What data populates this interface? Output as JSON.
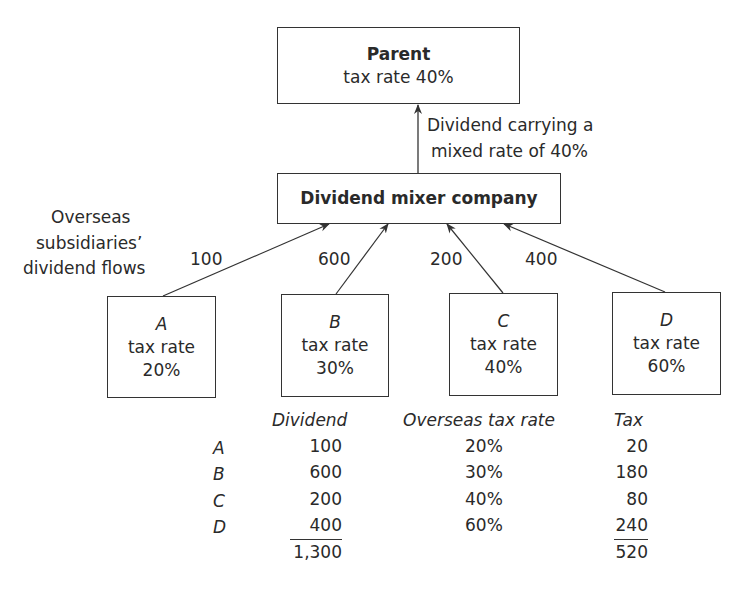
{
  "parent": {
    "title": "Parent",
    "rate": "tax rate 40%"
  },
  "parent_arrow_label": {
    "line1": "Dividend carrying a",
    "line2": "mixed rate of 40%"
  },
  "mixer": {
    "title": "Dividend mixer company"
  },
  "side_label": {
    "line1": "Overseas",
    "line2": "subsidiaries’",
    "line3": "dividend flows"
  },
  "subsidiaries": [
    {
      "name": "A",
      "rate_label": "tax rate",
      "rate": "20%",
      "flow": "100"
    },
    {
      "name": "B",
      "rate_label": "tax rate",
      "rate": "30%",
      "flow": "600"
    },
    {
      "name": "C",
      "rate_label": "tax rate",
      "rate": "40%",
      "flow": "200"
    },
    {
      "name": "D",
      "rate_label": "tax rate",
      "rate": "60%",
      "flow": "400"
    }
  ],
  "table": {
    "headers": {
      "dividend": "Dividend",
      "rate": "Overseas tax rate",
      "tax": "Tax"
    },
    "rows": [
      {
        "sub": "A",
        "dividend": "100",
        "rate": "20%",
        "tax": "20"
      },
      {
        "sub": "B",
        "dividend": "600",
        "rate": "30%",
        "tax": "180"
      },
      {
        "sub": "C",
        "dividend": "200",
        "rate": "40%",
        "tax": "80"
      },
      {
        "sub": "D",
        "dividend": "400",
        "rate": "60%",
        "tax": "240"
      }
    ],
    "totals": {
      "dividend": "1,300",
      "tax": "520"
    }
  }
}
